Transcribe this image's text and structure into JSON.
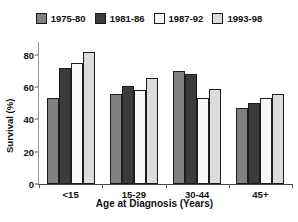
{
  "chart_data": {
    "type": "bar",
    "title": "",
    "xlabel": "Age at Diagnosis (Years)",
    "ylabel": "Survival (%)",
    "categories": [
      "<15",
      "15-29",
      "30-44",
      "45+"
    ],
    "ylim": [
      0,
      88
    ],
    "yticks": [
      0,
      20,
      40,
      60,
      80
    ],
    "ytick_labels": [
      "0",
      "20",
      "40",
      "60",
      "80"
    ],
    "grid": false,
    "legend_position": "top",
    "series": [
      {
        "name": "1975-80",
        "color": "#808080",
        "values": [
          53,
          56,
          70,
          47
        ]
      },
      {
        "name": "1981-86",
        "color": "#3b3b3b",
        "values": [
          72,
          61,
          68,
          50
        ]
      },
      {
        "name": "1987-92",
        "color": "#f7f7f7",
        "values": [
          75,
          58,
          53,
          53
        ]
      },
      {
        "name": "1993-98",
        "color": "#dcdcdc",
        "values": [
          82,
          66,
          59,
          56
        ]
      }
    ]
  },
  "legend": {
    "items": [
      {
        "label": "1975-80",
        "color": "#808080"
      },
      {
        "label": "1981-86",
        "color": "#3b3b3b"
      },
      {
        "label": "1987-92",
        "color": "#f7f7f7"
      },
      {
        "label": "1993-98",
        "color": "#dcdcdc"
      }
    ]
  },
  "axes": {
    "y_title": "Survival (%)",
    "x_title": "Age at Diagnosis (Years)"
  }
}
